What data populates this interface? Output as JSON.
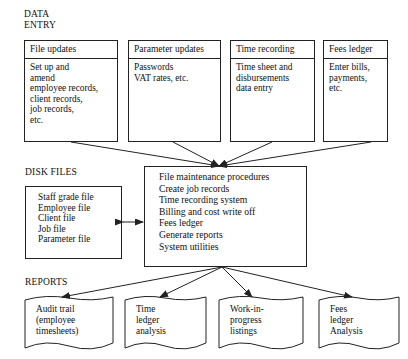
{
  "diagram": {
    "sections": {
      "data_entry": "DATA\nENTRY",
      "disk_files": "DISK FILES",
      "reports": "REPORTS"
    },
    "colors": {
      "line": "#222222",
      "background": "#ffffff",
      "text": "#111111"
    },
    "data_entry_boxes": [
      {
        "header": "File updates",
        "lines": [
          "Set up and",
          "amend",
          "employee records,",
          "client records,",
          "job records,",
          "etc."
        ]
      },
      {
        "header": "Parameter updates",
        "lines": [
          "Passwords",
          "VAT rates, etc."
        ]
      },
      {
        "header": "Time recording",
        "lines": [
          "Time sheet and",
          "disbursements",
          "data entry"
        ]
      },
      {
        "header": "Fees ledger",
        "lines": [
          "Enter bills,",
          "payments,",
          "etc."
        ]
      }
    ],
    "disk_files_box": {
      "lines": [
        "Staff grade file",
        "Employee file",
        "Client file",
        "Job file",
        "Parameter file"
      ]
    },
    "central_box": {
      "lines": [
        "File maintenance procedures",
        "Create job records",
        "Time recording system",
        "Billing and cost write off",
        "Fees ledger",
        "Generate reports",
        "System utilities"
      ]
    },
    "report_boxes": [
      {
        "lines": [
          "Audit trail",
          "(employee",
          "timesheets)"
        ]
      },
      {
        "lines": [
          "Time",
          "ledger",
          "analysis"
        ]
      },
      {
        "lines": [
          "Work-in-",
          "progress",
          "listings"
        ]
      },
      {
        "lines": [
          "Fees",
          "ledger",
          "Analysis"
        ]
      }
    ]
  }
}
